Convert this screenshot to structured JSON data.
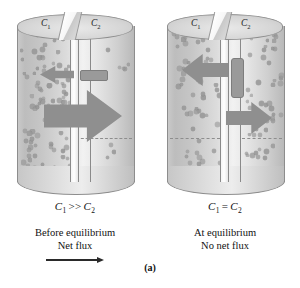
{
  "figure": {
    "label": "(a)",
    "panels": [
      {
        "id": "before-equilibrium",
        "top_labels": {
          "left": "C",
          "left_sub": "1",
          "right": "C",
          "right_sub": "2"
        },
        "concentration": {
          "left": "C",
          "left_sub": "1",
          "operator": ">>",
          "right": "C",
          "right_sub": "2"
        },
        "state_line1": "Before equilibrium",
        "state_line2": "Net flux",
        "has_net_flux_arrow": true,
        "flux_direction": "right",
        "left_dot_count": 96,
        "right_dot_count": 9,
        "arrows": [
          {
            "name": "leftward-flux-arrow",
            "direction": "left",
            "size": "small"
          },
          {
            "name": "rightward-flux-arrow",
            "direction": "right",
            "size": "large"
          }
        ]
      },
      {
        "id": "at-equilibrium",
        "top_labels": {
          "left": "C",
          "left_sub": "1",
          "right": "C",
          "right_sub": "2"
        },
        "concentration": {
          "left": "C",
          "left_sub": "1",
          "operator": "=",
          "right": "C",
          "right_sub": "2"
        },
        "state_line1": "At equilibrium",
        "state_line2": "No net flux",
        "has_net_flux_arrow": false,
        "flux_direction": "none",
        "left_dot_count": 54,
        "right_dot_count": 52,
        "arrows": [
          {
            "name": "leftward-flux-arrow",
            "direction": "left",
            "size": "medium"
          },
          {
            "name": "rightward-flux-arrow",
            "direction": "right",
            "size": "medium"
          }
        ]
      }
    ]
  },
  "colors": {
    "particle": "#9a9a9a",
    "arrow": "#8f8f8f",
    "outline": "#8d8d8d",
    "text": "#111111",
    "background": "#ffffff"
  },
  "chart_data": {
    "type": "diagram",
    "panels": [
      {
        "name": "Before equilibrium",
        "relation": "C1 >> C2",
        "left_concentration_relative": 1.0,
        "right_concentration_relative": 0.1,
        "flux_left_to_right": 1.0,
        "flux_right_to_left": 0.25,
        "net_flux": 0.75,
        "net_flux_direction": "left-to-right"
      },
      {
        "name": "At equilibrium",
        "relation": "C1 = C2",
        "left_concentration_relative": 0.55,
        "right_concentration_relative": 0.55,
        "flux_left_to_right": 0.5,
        "flux_right_to_left": 0.5,
        "net_flux": 0.0,
        "net_flux_direction": "none"
      }
    ]
  }
}
